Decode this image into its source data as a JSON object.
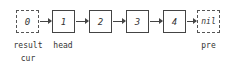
{
  "diagram": {
    "nodes": [
      {
        "value": "0",
        "style": "dashed"
      },
      {
        "value": "1",
        "style": "solid"
      },
      {
        "value": "2",
        "style": "solid"
      },
      {
        "value": "3",
        "style": "solid"
      },
      {
        "value": "4",
        "style": "solid"
      },
      {
        "value": "nil",
        "style": "dashed"
      }
    ],
    "labels": {
      "result": "result",
      "cur": "cur",
      "head": "head",
      "pre": "pre"
    }
  }
}
